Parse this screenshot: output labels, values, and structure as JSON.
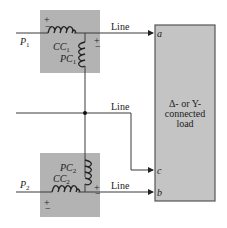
{
  "diagram": {
    "inputs": [
      {
        "name": "P",
        "sub": "1"
      },
      {
        "name": "P",
        "sub": "2"
      }
    ],
    "wattmeter1": {
      "current_coil": {
        "name": "CC",
        "sub": "1"
      },
      "potential_coil": {
        "name": "PC",
        "sub": "1"
      },
      "plus": "+",
      "minus": "−"
    },
    "wattmeter2": {
      "current_coil": {
        "name": "CC",
        "sub": "2"
      },
      "potential_coil": {
        "name": "PC",
        "sub": "2"
      },
      "plus": "+",
      "minus": "−"
    },
    "lines": {
      "top": "Line",
      "middle": "Line",
      "bottom": "Line"
    },
    "terminals": {
      "a": "a",
      "c": "c",
      "b": "b"
    },
    "load": {
      "line1": "Δ- or Y-",
      "line2": "connected",
      "line3": "load"
    },
    "colors": {
      "meter_box": "#b3b3b3",
      "load_box": "#c4c4c4",
      "wire": "#3a3a3a"
    }
  }
}
